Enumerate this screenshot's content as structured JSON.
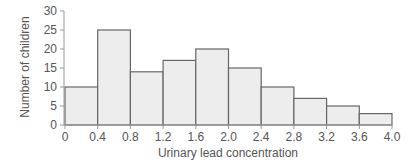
{
  "chart_data": {
    "type": "bar",
    "subtype": "histogram",
    "title": "",
    "xlabel": "Urinary lead concentration",
    "ylabel": "Number of children",
    "bin_edges": [
      0,
      0.4,
      0.8,
      1.2,
      1.6,
      2.0,
      2.4,
      2.8,
      3.2,
      3.6,
      4.0
    ],
    "categories": [
      "0-0.4",
      "0.4-0.8",
      "0.8-1.2",
      "1.2-1.6",
      "1.6-2.0",
      "2.0-2.4",
      "2.4-2.8",
      "2.8-3.2",
      "3.2-3.6",
      "3.6-4.0"
    ],
    "values": [
      10,
      25,
      14,
      17,
      20,
      15,
      10,
      7,
      5,
      3
    ],
    "xticks": [
      "0",
      "0.4",
      "0.8",
      "1.2",
      "1.6",
      "2.0",
      "2.4",
      "2.8",
      "3.2",
      "3.6",
      "4.0"
    ],
    "yticks": [
      "0",
      "5",
      "10",
      "15",
      "20",
      "25",
      "30"
    ],
    "xlim": [
      0,
      4.0
    ],
    "ylim": [
      0,
      30
    ],
    "grid": false,
    "legend": null,
    "colors": {
      "bar_fill": "#ededed",
      "bar_stroke": "#666666",
      "axis": "#999999",
      "text": "#555555"
    }
  }
}
